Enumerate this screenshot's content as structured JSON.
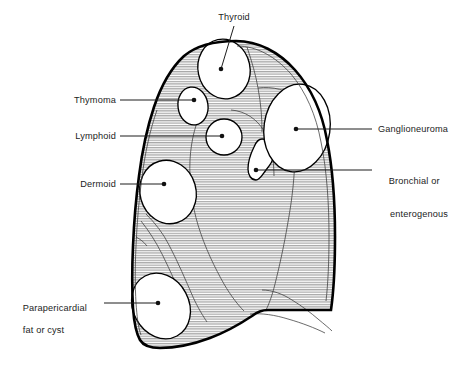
{
  "figure": {
    "title_fragment": "",
    "background_color": "#ffffff",
    "outline_color": "#000000",
    "hatch_color": "#9a9a9a",
    "mass_fill_color": "#ffffff",
    "leader_color": "#1c1c1c"
  },
  "labels": [
    {
      "id": "thyroid",
      "text": "Thyroid",
      "align": "center",
      "x": 204,
      "y": 12,
      "width": 60,
      "leader": {
        "x1": 234,
        "y1": 26,
        "x2": 221,
        "y2": 69
      },
      "marker": {
        "cx": 221,
        "cy": 69
      }
    },
    {
      "id": "thymoma",
      "text": "Thymoma",
      "align": "right",
      "x": 46,
      "y": 95,
      "width": 70,
      "leader": {
        "x1": 120,
        "y1": 100,
        "x2": 194,
        "y2": 100
      },
      "marker": {
        "cx": 194,
        "cy": 100
      }
    },
    {
      "id": "lymphoid",
      "text": "Lymphoid",
      "align": "right",
      "x": 46,
      "y": 131,
      "width": 70,
      "leader": {
        "x1": 120,
        "y1": 136,
        "x2": 222,
        "y2": 136
      },
      "marker": {
        "cx": 222,
        "cy": 136
      }
    },
    {
      "id": "dermoid",
      "text": "Dermoid",
      "align": "right",
      "x": 46,
      "y": 179,
      "width": 70,
      "leader": {
        "x1": 120,
        "y1": 184,
        "x2": 164,
        "y2": 184
      },
      "marker": {
        "cx": 164,
        "cy": 184
      }
    },
    {
      "id": "parapericardial",
      "text": "Parapericardial\nfat or cyst",
      "line1": "Parapericardial",
      "line2": "fat or cyst",
      "align": "left",
      "x": 12,
      "y": 292,
      "width": 88,
      "leader": {
        "x1": 104,
        "y1": 303,
        "x2": 158,
        "y2": 303
      },
      "marker": {
        "cx": 158,
        "cy": 303
      }
    },
    {
      "id": "ganglioneuroma",
      "text": "Ganglioneuroma",
      "align": "left",
      "x": 378,
      "y": 124,
      "width": 92,
      "leader": {
        "x1": 372,
        "y1": 129,
        "x2": 296,
        "y2": 129
      },
      "marker": {
        "cx": 296,
        "cy": 129
      }
    },
    {
      "id": "bronchial",
      "text": "Bronchial or\n    enterogenous",
      "line1": "Bronchial or",
      "line2": "enterogenous",
      "align": "left",
      "x": 378,
      "y": 165,
      "width": 92,
      "leader": {
        "x1": 372,
        "y1": 170,
        "x2": 256,
        "y2": 170
      },
      "marker": {
        "cx": 256,
        "cy": 170
      }
    }
  ],
  "masses": [
    {
      "id": "thyroid-mass",
      "name": "thyroid-mass",
      "label_ref": "thyroid"
    },
    {
      "id": "thymoma-mass",
      "name": "thymoma-mass",
      "label_ref": "thymoma"
    },
    {
      "id": "lymphoid-mass",
      "name": "lymphoid-mass",
      "label_ref": "lymphoid"
    },
    {
      "id": "dermoid-mass",
      "name": "dermoid-mass",
      "label_ref": "dermoid"
    },
    {
      "id": "parapericardial-mass",
      "name": "parapericardial-mass",
      "label_ref": "parapericardial"
    },
    {
      "id": "ganglioneuroma-mass",
      "name": "ganglioneuroma-mass",
      "label_ref": "ganglioneuroma"
    },
    {
      "id": "bronchial-mass",
      "name": "bronchial-mass",
      "label_ref": "bronchial"
    }
  ]
}
